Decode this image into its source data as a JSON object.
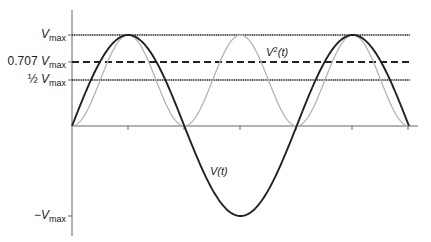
{
  "chart_data": {
    "type": "line",
    "title": "",
    "xlabel": "",
    "ylabel": "",
    "x_domain": [
      0,
      6.2832
    ],
    "ylim": [
      -1,
      1
    ],
    "grid": false,
    "legend": "inline annotations",
    "y_tick_labels": [
      {
        "text_prefix": "",
        "symbol": "V",
        "sub": "max",
        "value": 1.0
      },
      {
        "text_prefix": "0.707 ",
        "symbol": "V",
        "sub": "max",
        "value": 0.707
      },
      {
        "text_prefix": "½ ",
        "symbol": "V",
        "sub": "max",
        "value": 0.5
      },
      {
        "text_prefix": "−",
        "symbol": "V",
        "sub": "max",
        "value": -1.0
      }
    ],
    "reference_lines": [
      {
        "value": 1.0,
        "style": "dotted-solid",
        "label": "Vmax"
      },
      {
        "value": 0.707,
        "style": "dashed",
        "label": "0.707 Vmax"
      },
      {
        "value": 0.5,
        "style": "dotted-solid",
        "label": "½ Vmax"
      }
    ],
    "series": [
      {
        "name": "V(t)",
        "label_symbol": "V",
        "label_arg": "t",
        "function": "sin(t)",
        "periods": 1.5,
        "color": "#222222",
        "width": 2
      },
      {
        "name": "V²(t)",
        "label_symbol": "V",
        "label_sup": "2",
        "label_arg": "t",
        "function": "sin²(t)",
        "periods": 1.5,
        "color": "#b0b0b0",
        "width": 1.2
      }
    ],
    "x_ticks_count": 6
  },
  "labels": {
    "vmax": {
      "symbol": "V",
      "sub": "max"
    },
    "v0707": {
      "prefix": "0.707 ",
      "symbol": "V",
      "sub": "max"
    },
    "vhalf": {
      "prefix": "½ ",
      "symbol": "V",
      "sub": "max"
    },
    "vneg": {
      "prefix": "−",
      "symbol": "V",
      "sub": "max"
    },
    "vsq": {
      "symbol": "V",
      "sup": "2",
      "arg": "(t)"
    },
    "vt": {
      "symbol": "V",
      "arg": "(t)"
    }
  }
}
